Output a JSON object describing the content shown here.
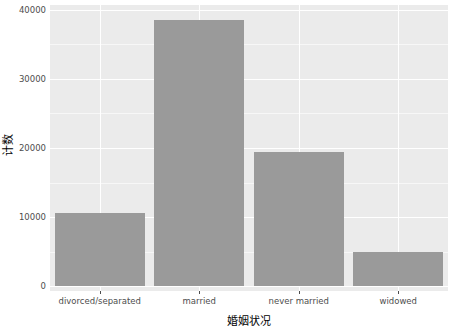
{
  "chart_data": {
    "type": "bar",
    "title": "",
    "subtitle": "",
    "xlabel": "婚姻状况",
    "ylabel": "计数",
    "categories": [
      "divorced/separated",
      "married",
      "never married",
      "widowed"
    ],
    "values": [
      10600,
      38500,
      19400,
      4900
    ],
    "series": [
      {
        "name": "计数",
        "values": [
          10600,
          38500,
          19400,
          4900
        ]
      }
    ],
    "ylim": [
      0,
      40000
    ],
    "y_ticks": [
      0,
      10000,
      20000,
      30000,
      40000
    ],
    "y_tick_labels": [
      "0",
      "10000",
      "20000",
      "30000",
      "40000"
    ],
    "y_minor_ticks": [
      5000,
      15000,
      25000,
      35000
    ],
    "grid": true,
    "legend": "none",
    "bar_color": "#9a9a9a",
    "panel_color": "#ebebeb",
    "grid_color": "#ffffff",
    "axis_text_color": "#4d4d4d",
    "axis_title_color": "#000000"
  }
}
